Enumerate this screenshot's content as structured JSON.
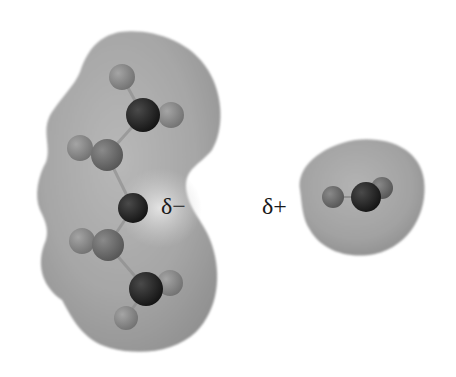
{
  "figure": {
    "labels": {
      "negative": "δ−",
      "positive": "δ+"
    },
    "colors": {
      "background": "#ffffff",
      "surface_light": "#c9c9c9",
      "surface_mid": "#a9a9a9",
      "surface_dark": "#8a8a8a",
      "atom_dark": "#1c1c1c",
      "atom_mid": "#6e6e6e",
      "atom_light": "#8f8f8f",
      "label": "#1a1a1a"
    },
    "molecules": [
      {
        "name": "left-molecule",
        "partial_charge": "δ−",
        "atoms": [
          {
            "type": "H",
            "shade": "light",
            "x": 122,
            "y": 77,
            "r": 13
          },
          {
            "type": "C",
            "shade": "dark",
            "x": 143,
            "y": 115,
            "r": 17
          },
          {
            "type": "H",
            "shade": "light",
            "x": 171,
            "y": 115,
            "r": 13
          },
          {
            "type": "H",
            "shade": "light",
            "x": 80,
            "y": 148,
            "r": 13
          },
          {
            "type": "C",
            "shade": "mid",
            "x": 107,
            "y": 155,
            "r": 16
          },
          {
            "type": "O",
            "shade": "dark",
            "x": 133,
            "y": 208,
            "r": 15
          },
          {
            "type": "H",
            "shade": "light",
            "x": 82,
            "y": 241,
            "r": 13
          },
          {
            "type": "C",
            "shade": "mid",
            "x": 108,
            "y": 245,
            "r": 16
          },
          {
            "type": "H",
            "shade": "light",
            "x": 170,
            "y": 283,
            "r": 13
          },
          {
            "type": "C",
            "shade": "dark",
            "x": 146,
            "y": 289,
            "r": 17
          },
          {
            "type": "H",
            "shade": "light",
            "x": 126,
            "y": 318,
            "r": 12
          }
        ]
      },
      {
        "name": "right-molecule",
        "partial_charge": "δ+",
        "atoms": [
          {
            "type": "H",
            "shade": "mid",
            "x": 333,
            "y": 197,
            "r": 11
          },
          {
            "type": "H",
            "shade": "mid",
            "x": 382,
            "y": 188,
            "r": 11
          },
          {
            "type": "X",
            "shade": "dark",
            "x": 366,
            "y": 197,
            "r": 15
          }
        ]
      }
    ]
  }
}
